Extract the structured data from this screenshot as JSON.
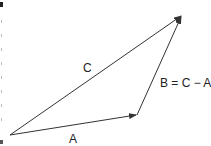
{
  "diagram": {
    "type": "vector-triangle",
    "colors": {
      "line": "#333333",
      "text": "#222222",
      "background": "#ffffff"
    },
    "points": {
      "origin": {
        "x": 10,
        "y": 135
      },
      "a_head": {
        "x": 137,
        "y": 115
      },
      "c_head": {
        "x": 182,
        "y": 15
      }
    },
    "vectors": [
      {
        "id": "A",
        "label": "A",
        "from": "origin",
        "to": "a_head"
      },
      {
        "id": "C",
        "label": "C",
        "from": "origin",
        "to": "c_head"
      },
      {
        "id": "B",
        "label": "B = C − A",
        "from": "a_head",
        "to": "c_head"
      }
    ],
    "labels": {
      "c": "C",
      "a": "A",
      "b": "B = C − A"
    }
  }
}
